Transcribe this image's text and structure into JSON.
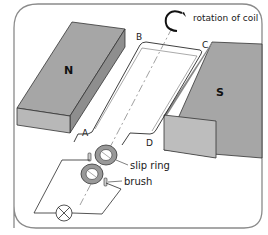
{
  "diagram": {
    "magnets": [
      {
        "label": "N",
        "color": "#a8a8a8",
        "side_color": "#bdbdbd"
      },
      {
        "label": "S",
        "color": "#a8a8a8",
        "side_color": "#bdbdbd"
      }
    ],
    "coil_corners": [
      "A",
      "B",
      "C",
      "D"
    ],
    "annotations": {
      "rotation": "rotation of coil",
      "slip_ring": "slip ring",
      "brush": "brush"
    },
    "components": {
      "lamp": "lamp-icon",
      "axis": "dash-dot rotation axis"
    },
    "colors": {
      "frame": "#7a7a7a",
      "line": "#2a2a2a",
      "ring": "#8c8c8c",
      "background": "#ffffff"
    }
  }
}
